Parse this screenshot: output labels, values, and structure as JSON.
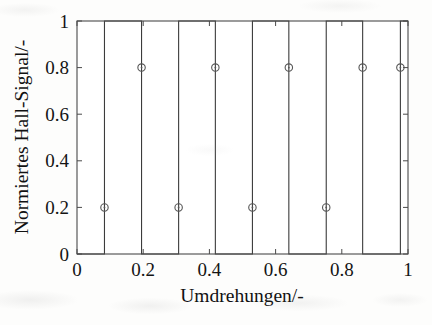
{
  "chart_data": {
    "type": "line",
    "title": "",
    "xlabel": "Umdrehungen/-",
    "ylabel": "Normiertes Hall-Signal/-",
    "xlim": [
      0,
      1
    ],
    "ylim": [
      0,
      1
    ],
    "grid": false,
    "legend": null,
    "xticks": [
      0,
      0.2,
      0.4,
      0.6,
      0.8,
      1
    ],
    "xtick_labels": [
      "0",
      "0.2",
      "0.4",
      "0.6",
      "0.8",
      "1"
    ],
    "yticks": [
      0,
      0.2,
      0.4,
      0.6,
      0.8,
      1
    ],
    "ytick_labels": [
      "0",
      "0.2",
      "0.4",
      "0.6",
      "0.8",
      "1"
    ],
    "series": [
      {
        "name": "Normiertes Hall-Signal",
        "kind": "square-wave",
        "color": "#3c3c3c",
        "line_width": 1.1,
        "description": "Rechtecksignal, Tastverhaeltnis ca. 50 Prozent, 4.5 Perioden ueber eine Umdrehung",
        "points": [
          {
            "x": 0.0,
            "y": 0
          },
          {
            "x": 0.083,
            "y": 0
          },
          {
            "x": 0.083,
            "y": 1
          },
          {
            "x": 0.195,
            "y": 1
          },
          {
            "x": 0.195,
            "y": 0
          },
          {
            "x": 0.307,
            "y": 0
          },
          {
            "x": 0.307,
            "y": 1
          },
          {
            "x": 0.418,
            "y": 1
          },
          {
            "x": 0.418,
            "y": 0
          },
          {
            "x": 0.53,
            "y": 0
          },
          {
            "x": 0.53,
            "y": 1
          },
          {
            "x": 0.64,
            "y": 1
          },
          {
            "x": 0.64,
            "y": 0
          },
          {
            "x": 0.753,
            "y": 0
          },
          {
            "x": 0.753,
            "y": 1
          },
          {
            "x": 0.863,
            "y": 1
          },
          {
            "x": 0.863,
            "y": 0
          },
          {
            "x": 0.977,
            "y": 0
          },
          {
            "x": 0.977,
            "y": 1
          },
          {
            "x": 1.0,
            "y": 1
          }
        ]
      },
      {
        "name": "Schaltpunkte",
        "kind": "scatter",
        "marker": "circle-open",
        "color": "#555555",
        "marker_size": 5,
        "points": [
          {
            "x": 0.083,
            "y": 0.2
          },
          {
            "x": 0.195,
            "y": 0.8
          },
          {
            "x": 0.307,
            "y": 0.2
          },
          {
            "x": 0.418,
            "y": 0.8
          },
          {
            "x": 0.53,
            "y": 0.2
          },
          {
            "x": 0.64,
            "y": 0.8
          },
          {
            "x": 0.753,
            "y": 0.2
          },
          {
            "x": 0.863,
            "y": 0.8
          },
          {
            "x": 0.977,
            "y": 0.8
          }
        ]
      }
    ]
  }
}
